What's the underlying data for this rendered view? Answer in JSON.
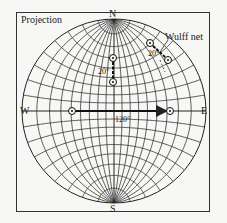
{
  "figure": {
    "title": "Projection",
    "net_label": "Wulff net",
    "directions": {
      "north": "N",
      "south": "S",
      "east": "E",
      "west": "W"
    },
    "angles": [
      {
        "id": "vertical-pair",
        "label": "20°"
      },
      {
        "id": "rim-pair",
        "label": "20°"
      },
      {
        "id": "horizontal-pair",
        "label": "120°"
      }
    ],
    "colors": {
      "line": "#222222",
      "background": "#f7f7f5"
    }
  }
}
